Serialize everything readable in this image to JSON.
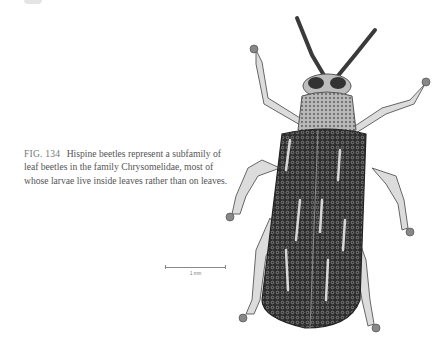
{
  "figure": {
    "number": "FIG. 134",
    "caption": "Hispine beetles represent a subfamily of leaf beetles in the family Chrysomelidae, most of whose larvae live inside leaves rather than on leaves.",
    "scale_bar": {
      "label": "1 mm"
    },
    "illustration": "Dorsal view of a hispine leaf beetle"
  },
  "colors": {
    "text": "#555555",
    "elytra_dark": "#2b2b2b",
    "leg_light": "#d9d9d9"
  }
}
